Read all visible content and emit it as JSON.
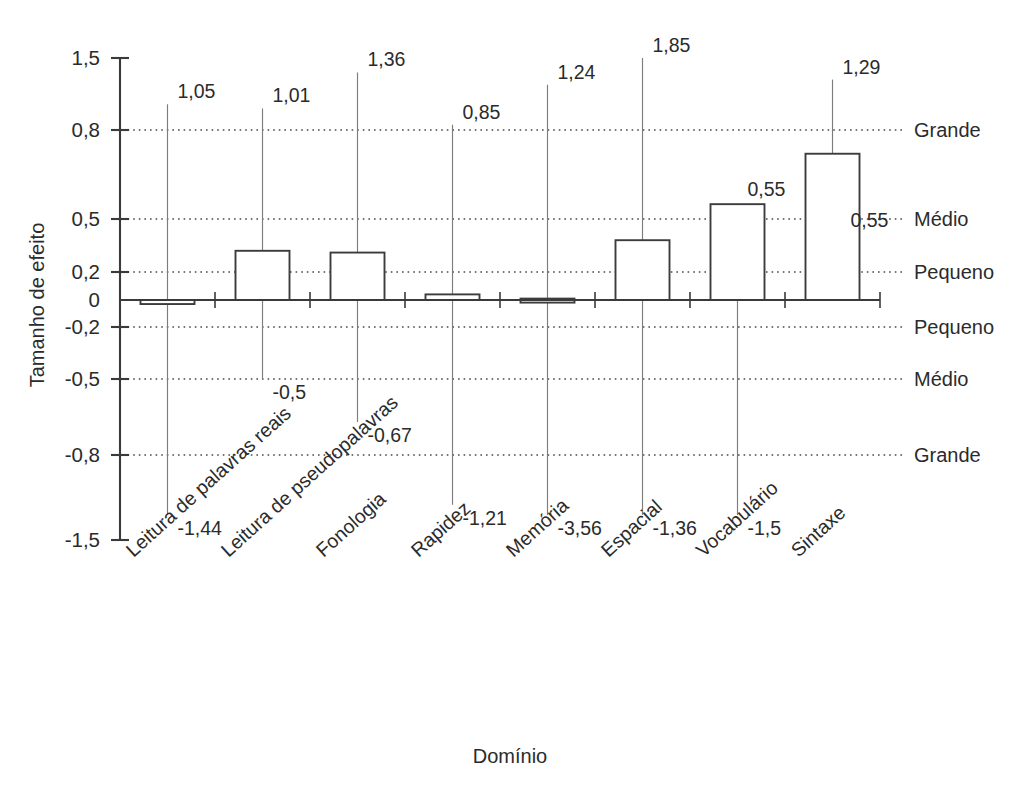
{
  "chart_data": {
    "type": "bar",
    "title": "",
    "xlabel": "Domínio",
    "ylabel": "Tamanho de efeito",
    "categories": [
      "Leitura de palavras reais",
      "Leitura de pseudopalavras",
      "Fonologia",
      "Rapidez",
      "Memória",
      "Espacial",
      "Vocabulário",
      "Sintaxe"
    ],
    "values": [
      -0.03,
      0.32,
      0.31,
      0.04,
      0.01,
      0.38,
      0.55,
      0.72
    ],
    "error_upper": [
      1.05,
      1.01,
      1.36,
      0.85,
      1.24,
      1.85,
      0.55,
      1.29
    ],
    "error_lower": [
      -1.44,
      -0.5,
      -0.67,
      -1.21,
      -3.56,
      -1.36,
      -1.5,
      0.55
    ],
    "upper_labels": [
      "1,05",
      "1,01",
      "1,36",
      "0,85",
      "1,24",
      "1,85",
      "0,55",
      "1,29"
    ],
    "lower_labels": [
      "-1,44",
      "-0,5",
      "-0,67",
      "-1,21",
      "-3,56",
      "-1,36",
      "-1,5",
      "0,55"
    ],
    "ytick_labels": [
      "1,5",
      "0,8",
      "0,5",
      "0,2",
      "0",
      "-0,2",
      "-0,5",
      "-0,8",
      "-1,5"
    ],
    "ytick_values": [
      1.5,
      0.8,
      0.5,
      0.2,
      0,
      -0.2,
      -0.5,
      -0.8,
      -1.5
    ],
    "effect_bands": [
      {
        "label": "Grande",
        "value": 0.8
      },
      {
        "label": "Médio",
        "value": 0.5
      },
      {
        "label": "Pequeno",
        "value": 0.2
      },
      {
        "label": "Pequeno",
        "value": -0.2
      },
      {
        "label": "Médio",
        "value": -0.5
      },
      {
        "label": "Grande",
        "value": -0.8
      }
    ],
    "ylim": [
      -1.5,
      1.5
    ],
    "grid": "horizontal-dotted",
    "legend": "none",
    "colors": {
      "bar_fill": "#ffffff",
      "bar_stroke": "#3c3c3c",
      "axis": "#3a3a3a",
      "guide": "#4a4a4a",
      "whisker": "#7d7d7d",
      "text": "#2b2b2b",
      "background": "#ffffff"
    }
  }
}
